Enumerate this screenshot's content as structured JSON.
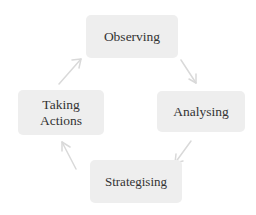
{
  "diagram": {
    "type": "cycle",
    "direction": "clockwise",
    "node_fill_color": "#eeeeee",
    "text_color": "#333333",
    "arrow_color": "#d8d8d8",
    "background_color": "#ffffff",
    "nodes": [
      {
        "id": "observing",
        "label": "Observing",
        "position": "top"
      },
      {
        "id": "analysing",
        "label": "Analysing",
        "position": "right"
      },
      {
        "id": "strategising",
        "label": "Strategising",
        "position": "bottom"
      },
      {
        "id": "taking-actions",
        "label": "Taking\nActions",
        "position": "left"
      }
    ],
    "arrows": [
      {
        "from": "observing",
        "to": "analysing",
        "direction": "down-right"
      },
      {
        "from": "analysing",
        "to": "strategising",
        "direction": "down-left"
      },
      {
        "from": "strategising",
        "to": "taking-actions",
        "direction": "up-left"
      },
      {
        "from": "taking-actions",
        "to": "observing",
        "direction": "up-right"
      }
    ]
  }
}
